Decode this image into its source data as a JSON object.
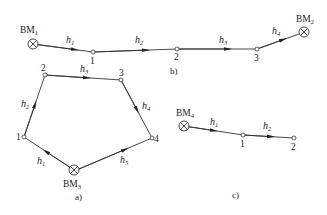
{
  "diagram": {
    "panels": [
      {
        "id": "a",
        "caption": "a)",
        "type": "closed-leveling-route",
        "benchmark": {
          "label": "BM",
          "sub": "3"
        },
        "points": [
          "1",
          "2",
          "3",
          "4"
        ],
        "segments": [
          {
            "label": "h",
            "sub": "1",
            "from": "BM3",
            "to": "1"
          },
          {
            "label": "h",
            "sub": "2",
            "from": "1",
            "to": "2"
          },
          {
            "label": "h",
            "sub": "3",
            "from": "2",
            "to": "3"
          },
          {
            "label": "h",
            "sub": "4",
            "from": "3",
            "to": "4"
          },
          {
            "label": "h",
            "sub": "5",
            "from": "4",
            "to": "BM3"
          }
        ]
      },
      {
        "id": "b",
        "caption": "b)",
        "type": "attached-leveling-route",
        "benchmarks": [
          {
            "label": "BM",
            "sub": "1"
          },
          {
            "label": "BM",
            "sub": "2"
          }
        ],
        "points": [
          "1",
          "2",
          "3"
        ],
        "segments": [
          {
            "label": "h",
            "sub": "1",
            "from": "BM1",
            "to": "1"
          },
          {
            "label": "h",
            "sub": "2",
            "from": "1",
            "to": "2"
          },
          {
            "label": "h",
            "sub": "3",
            "from": "2",
            "to": "3"
          },
          {
            "label": "h",
            "sub": "4",
            "from": "3",
            "to": "BM2"
          }
        ]
      },
      {
        "id": "c",
        "caption": "c)",
        "type": "spur-leveling-route",
        "benchmark": {
          "label": "BM",
          "sub": "4"
        },
        "points": [
          "1",
          "2"
        ],
        "segments": [
          {
            "label": "h",
            "sub": "1",
            "from": "BM4",
            "to": "1"
          },
          {
            "label": "h",
            "sub": "2",
            "from": "1",
            "to": "2"
          }
        ]
      }
    ]
  },
  "labels": {
    "bm": "BM",
    "h": "h",
    "s1": "1",
    "s2": "2",
    "s3": "3",
    "s4": "4",
    "s5": "5",
    "cap_a": "a)",
    "cap_b": "b)",
    "cap_c": "c)"
  }
}
